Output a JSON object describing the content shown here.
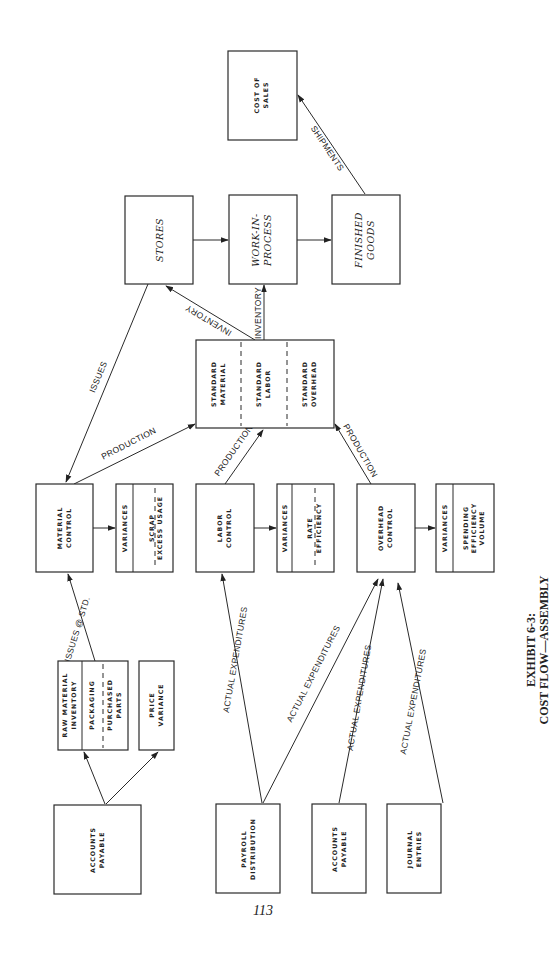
{
  "diagram": {
    "nodes": {
      "cost_of_sales": {
        "line1": "COST OF",
        "line2": "SALES"
      },
      "stores": {
        "line1": "STORES"
      },
      "wip": {
        "line1": "WORK-IN-",
        "line2": "PROCESS"
      },
      "finished_goods": {
        "line1": "FINISHED",
        "line2": "GOODS"
      },
      "standard": {
        "material": {
          "line1": "STANDARD",
          "line2": "MATERIAL"
        },
        "labor": {
          "line1": "STANDARD",
          "line2": "LABOR"
        },
        "overhead": {
          "line1": "STANDARD",
          "line2": "OVERHEAD"
        }
      },
      "material_control": {
        "line1": "MATERIAL",
        "line2": "CONTROL"
      },
      "material_variances": {
        "header": "VARIANCES",
        "line1": "SCRAP",
        "line2": "EXCESS USAGE"
      },
      "labor_control": {
        "line1": "LABOR",
        "line2": "CONTROL"
      },
      "labor_variances": {
        "header": "VARIANCES",
        "line1": "RATE",
        "line2": "EFFICIENCY"
      },
      "overhead_control": {
        "line1": "OVERHEAD",
        "line2": "CONTROL"
      },
      "overhead_variances": {
        "header": "VARIANCES",
        "line1": "SPENDING",
        "line2": "EFFICIENCY",
        "line3": "VOLUME"
      },
      "raw_material": {
        "header1": "RAW MATERIAL",
        "header2": "INVENTORY",
        "part1": "PACKAGING",
        "part2a": "PURCHASED",
        "part2b": "PARTS"
      },
      "price_variance": {
        "line1": "PRICE",
        "line2": "VARIANCE"
      },
      "accounts_payable_1": {
        "line1": "ACCOUNTS",
        "line2": "PAYABLE"
      },
      "payroll": {
        "line1": "PAYROLL",
        "line2": "DISTRIBUTION"
      },
      "accounts_payable_2": {
        "line1": "ACCOUNTS",
        "line2": "PAYABLE"
      },
      "journal_entries": {
        "line1": "JOURNAL",
        "line2": "ENTRIES"
      }
    },
    "edges": {
      "shipments": "SHIPMENTS",
      "inventory_to_stores": "INVENTORY",
      "inventory_to_wip": "INVENTORY",
      "issues": "ISSUES",
      "production_material": "PRODUCTION",
      "production_labor": "PRODUCTION",
      "production_overhead": "PRODUCTION",
      "issues_at_std": "ISSUES @ STD.",
      "actual_exp_1": "ACTUAL EXPENDITURES",
      "actual_exp_2": "ACTUAL EXPENDITURES",
      "actual_exp_3": "ACTUAL EXPENDITURES",
      "actual_exp_4": "ACTUAL EXPENDITURES"
    }
  },
  "page_number": "113",
  "caption": {
    "line1": "EXHIBIT 6-3:",
    "line2": "COST FLOW—ASSEMBLY"
  }
}
